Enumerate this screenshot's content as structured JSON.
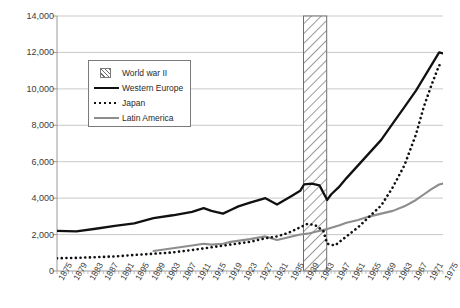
{
  "chart": {
    "type": "line",
    "ylabel": "Constant 1990 US$",
    "xlabel": "",
    "title": ""
  },
  "axes": {
    "y_ticks": [
      "0",
      "2,000",
      "4,000",
      "6,000",
      "8,000",
      "10,000",
      "12,000",
      "14,000"
    ],
    "x_ticks": [
      "1875",
      "1879",
      "1883",
      "1887",
      "1891",
      "1895",
      "1899",
      "1903",
      "1907",
      "1911",
      "1915",
      "1919",
      "1923",
      "1927",
      "1931",
      "1935",
      "1939",
      "1943",
      "1947",
      "1951",
      "1955",
      "1959",
      "1963",
      "1967",
      "1971",
      "1975"
    ]
  },
  "legend": {
    "items": [
      {
        "label": "World war II",
        "key": "hatch-swatch",
        "color": "#6e6e6e"
      },
      {
        "label": "Western Europe",
        "key": "solid-black-line",
        "color": "#111111"
      },
      {
        "label": "Japan",
        "key": "dotted-black-line",
        "color": "#111111"
      },
      {
        "label": "Latin America",
        "key": "solid-gray-line",
        "color": "#8d8d8d"
      }
    ]
  },
  "caption": "",
  "chart_data": {
    "type": "line",
    "title": "",
    "xlabel": "",
    "ylabel": "Constant 1990 US$",
    "ylim": [
      0,
      14000
    ],
    "xlim": [
      1875,
      1975
    ],
    "grid": true,
    "legend_position": "upper-left-inside",
    "annotations": [
      {
        "type": "vband",
        "label": "World war II",
        "x_start": 1939,
        "x_end": 1945,
        "style": "diagonal-hatch"
      }
    ],
    "series": [
      {
        "name": "Western Europe",
        "color": "#111111",
        "style": "solid",
        "x": [
          1875,
          1880,
          1885,
          1890,
          1895,
          1900,
          1905,
          1910,
          1913,
          1915,
          1918,
          1920,
          1922,
          1925,
          1929,
          1932,
          1934,
          1936,
          1938,
          1939,
          1941,
          1943,
          1945,
          1946,
          1948,
          1950,
          1953,
          1956,
          1959,
          1962,
          1965,
          1968,
          1970,
          1972,
          1974,
          1975
        ],
        "y": [
          2200,
          2180,
          2320,
          2480,
          2620,
          2900,
          3060,
          3250,
          3450,
          3300,
          3150,
          3350,
          3550,
          3750,
          4000,
          3650,
          3900,
          4150,
          4400,
          4750,
          4800,
          4700,
          3900,
          4200,
          4600,
          5100,
          5800,
          6500,
          7200,
          8100,
          9000,
          9900,
          10600,
          11300,
          12000,
          11950
        ]
      },
      {
        "name": "Japan",
        "color": "#111111",
        "style": "dotted",
        "x": [
          1875,
          1880,
          1885,
          1890,
          1895,
          1900,
          1905,
          1910,
          1915,
          1920,
          1925,
          1929,
          1932,
          1935,
          1938,
          1940,
          1942,
          1944,
          1945,
          1947,
          1950,
          1953,
          1956,
          1959,
          1962,
          1965,
          1968,
          1970,
          1972,
          1974,
          1975
        ],
        "y": [
          700,
          720,
          760,
          800,
          880,
          950,
          1020,
          1150,
          1300,
          1450,
          1600,
          1800,
          1900,
          2100,
          2400,
          2600,
          2500,
          2200,
          1500,
          1400,
          1900,
          2400,
          3000,
          3600,
          4600,
          5800,
          7500,
          9000,
          10200,
          11300,
          11300
        ]
      },
      {
        "name": "Latin America",
        "color": "#8d8d8d",
        "style": "solid",
        "x": [
          1900,
          1905,
          1910,
          1913,
          1915,
          1918,
          1920,
          1925,
          1929,
          1932,
          1935,
          1938,
          1940,
          1942,
          1945,
          1948,
          1950,
          1953,
          1956,
          1959,
          1962,
          1965,
          1968,
          1970,
          1972,
          1974,
          1975
        ],
        "y": [
          1100,
          1250,
          1400,
          1500,
          1450,
          1500,
          1600,
          1750,
          1900,
          1700,
          1850,
          2000,
          2050,
          2150,
          2300,
          2500,
          2650,
          2800,
          3000,
          3150,
          3300,
          3550,
          3900,
          4200,
          4500,
          4750,
          4800
        ]
      }
    ]
  }
}
